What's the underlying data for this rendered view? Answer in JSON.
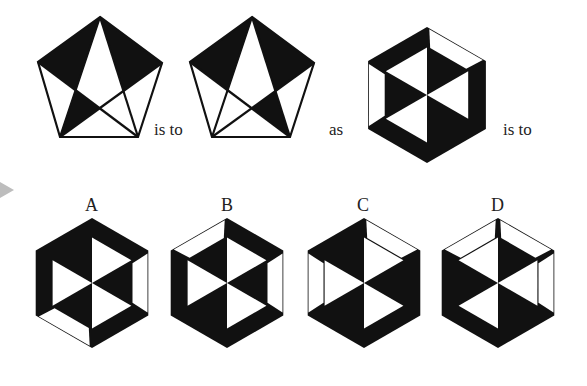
{
  "puzzle": {
    "type": "visual-analogy",
    "connectors": {
      "is_to_1": "is to",
      "as": "as",
      "is_to_2": "is to"
    },
    "colors": {
      "fill": "#111111",
      "background": "#ffffff",
      "arrow": "#bdbdbd"
    },
    "pentagons": [
      {
        "id": "premise-1",
        "offset_x": 0,
        "black_regions": [
          "top-left",
          "top-right",
          "lower-left"
        ]
      },
      {
        "id": "premise-2",
        "offset_x": 152,
        "black_regions": [
          "top-left",
          "top-right",
          "lower-right"
        ]
      }
    ],
    "question_hexagon": {
      "cx": 427,
      "cy": 95,
      "r": 68,
      "white_triangles": [
        1,
        3,
        5
      ],
      "white_bands": [
        0,
        4
      ]
    },
    "options": [
      {
        "label": "A",
        "cx": 92,
        "cy": 283,
        "r": 65,
        "white_triangles": [
          0,
          2,
          4
        ],
        "white_bands": [
          1,
          3
        ]
      },
      {
        "label": "B",
        "cx": 227,
        "cy": 283,
        "r": 65,
        "white_triangles": [
          0,
          2,
          4
        ],
        "white_bands": [
          1,
          5
        ]
      },
      {
        "label": "C",
        "cx": 364,
        "cy": 283,
        "r": 65,
        "white_triangles": [
          0,
          2,
          4
        ],
        "white_bands": [
          0,
          4
        ]
      },
      {
        "label": "D",
        "cx": 498,
        "cy": 283,
        "r": 65,
        "white_triangles": [
          1,
          3,
          5
        ],
        "white_bands": [
          0,
          1,
          5
        ]
      }
    ]
  }
}
